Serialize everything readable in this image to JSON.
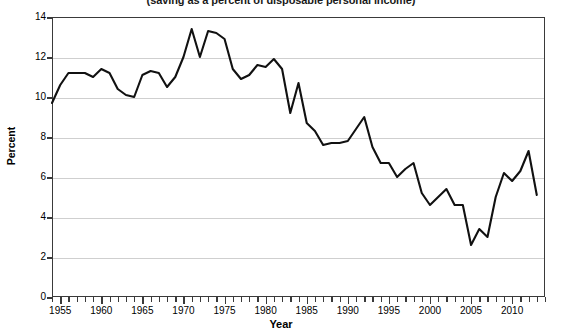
{
  "chart_data": {
    "type": "line",
    "title": "(saving as a percent of disposable personal income)",
    "subtitle": "(saving as a percent of disposable personal income)",
    "xlabel": "Year",
    "ylabel": "Percent",
    "xlim": [
      1954,
      2014
    ],
    "ylim": [
      0,
      14
    ],
    "ytick_step": 2,
    "yticks": [
      0,
      2,
      4,
      6,
      8,
      10,
      12,
      14
    ],
    "xticks_major": [
      1955,
      1960,
      1965,
      1970,
      1975,
      1980,
      1985,
      1990,
      1995,
      2000,
      2005,
      2010
    ],
    "xtick_minor_step": 1,
    "grid": "horizontal",
    "legend": "none",
    "line_color": "#111111",
    "grid_color": "#cfcfcf",
    "axis_color": "#3a3a3a",
    "series": [
      {
        "name": "Personal saving rate",
        "x": [
          1954,
          1955,
          1956,
          1957,
          1958,
          1959,
          1960,
          1961,
          1962,
          1963,
          1964,
          1965,
          1966,
          1967,
          1968,
          1969,
          1970,
          1971,
          1972,
          1973,
          1974,
          1975,
          1976,
          1977,
          1978,
          1979,
          1980,
          1981,
          1982,
          1983,
          1984,
          1985,
          1986,
          1987,
          1988,
          1989,
          1990,
          1991,
          1992,
          1993,
          1994,
          1995,
          1996,
          1997,
          1998,
          1999,
          2000,
          2001,
          2002,
          2003,
          2004,
          2005,
          2006,
          2007,
          2008,
          2009,
          2010,
          2011,
          2012,
          2013
        ],
        "values": [
          9.7,
          10.6,
          11.2,
          11.2,
          11.2,
          11.0,
          11.4,
          11.2,
          10.4,
          10.1,
          10.0,
          11.1,
          11.3,
          11.2,
          10.5,
          11.0,
          12.0,
          13.4,
          12.0,
          13.3,
          13.2,
          12.9,
          11.4,
          10.9,
          11.1,
          11.6,
          11.5,
          11.9,
          11.4,
          9.2,
          10.7,
          8.7,
          8.3,
          7.6,
          7.7,
          7.7,
          7.8,
          8.4,
          9.0,
          7.5,
          6.7,
          6.7,
          6.0,
          6.4,
          6.7,
          5.2,
          4.6,
          5.0,
          5.4,
          4.6,
          4.6,
          2.6,
          3.4,
          3.0,
          5.0,
          6.2,
          5.8,
          6.3,
          7.3,
          5.1
        ]
      }
    ]
  },
  "labels": {
    "ylabel": "Percent",
    "xlabel": "Year"
  }
}
